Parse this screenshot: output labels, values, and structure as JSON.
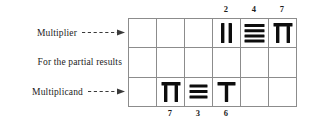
{
  "diagram": {
    "grid": {
      "columns": 6,
      "rows": 3
    },
    "row_labels": [
      {
        "text": "Multiplier",
        "arrow": "dashed-arrow-right",
        "has_arrow": true
      },
      {
        "text": "For the partial results",
        "arrow": "",
        "has_arrow": false
      },
      {
        "text": "Multiplicand",
        "arrow": "dashed-arrow-right",
        "has_arrow": true
      }
    ],
    "top_annotations": [
      {
        "value": "2",
        "column": 4
      },
      {
        "value": "4",
        "column": 5
      },
      {
        "value": "7",
        "column": 6
      }
    ],
    "bottom_annotations": [
      {
        "value": "7",
        "column": 2
      },
      {
        "value": "3",
        "column": 3
      },
      {
        "value": "6",
        "column": 4
      }
    ],
    "cells": [
      {
        "row": 1,
        "column": 1,
        "glyph": "",
        "value": ""
      },
      {
        "row": 1,
        "column": 2,
        "glyph": "",
        "value": ""
      },
      {
        "row": 1,
        "column": 3,
        "glyph": "",
        "value": ""
      },
      {
        "row": 1,
        "column": 4,
        "glyph": "rod-two-vertical-bars",
        "value": "2"
      },
      {
        "row": 1,
        "column": 5,
        "glyph": "rod-four-horizontal-bars",
        "value": "4"
      },
      {
        "row": 1,
        "column": 6,
        "glyph": "rod-seven-pi",
        "value": "7"
      },
      {
        "row": 2,
        "column": 1,
        "glyph": "",
        "value": ""
      },
      {
        "row": 2,
        "column": 2,
        "glyph": "",
        "value": ""
      },
      {
        "row": 2,
        "column": 3,
        "glyph": "",
        "value": ""
      },
      {
        "row": 2,
        "column": 4,
        "glyph": "",
        "value": ""
      },
      {
        "row": 2,
        "column": 5,
        "glyph": "",
        "value": ""
      },
      {
        "row": 2,
        "column": 6,
        "glyph": "",
        "value": ""
      },
      {
        "row": 3,
        "column": 1,
        "glyph": "",
        "value": ""
      },
      {
        "row": 3,
        "column": 2,
        "glyph": "rod-seven-pi",
        "value": "7"
      },
      {
        "row": 3,
        "column": 3,
        "glyph": "rod-three-horizontal-bars",
        "value": "3"
      },
      {
        "row": 3,
        "column": 4,
        "glyph": "rod-six-tee",
        "value": "6"
      },
      {
        "row": 3,
        "column": 5,
        "glyph": "",
        "value": ""
      },
      {
        "row": 3,
        "column": 6,
        "glyph": "",
        "value": ""
      }
    ],
    "colors": {
      "grid_line": "#8c8c8c",
      "glyph": "#0d0d0d",
      "text": "#1c1c1c",
      "arrow": "#3a3a3a",
      "background": "#ffffff"
    }
  }
}
